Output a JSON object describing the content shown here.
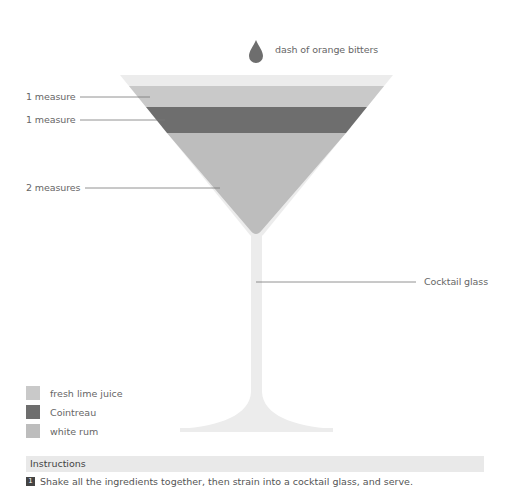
{
  "garnish": {
    "icon": "drop-icon",
    "label": "dash of orange bitters"
  },
  "layers": [
    {
      "label": "1 measure",
      "ingredient": "fresh lime juice",
      "color": "#c9c9c9"
    },
    {
      "label": "1 measure",
      "ingredient": "Cointreau",
      "color": "#6e6e6e"
    },
    {
      "label": "2 measures",
      "ingredient": "white rum",
      "color": "#bdbdbd"
    }
  ],
  "glass": {
    "label": "Cocktail glass",
    "color": "#ececec"
  },
  "legend": [
    {
      "label": "fresh lime juice",
      "color": "#c9c9c9"
    },
    {
      "label": "Cointreau",
      "color": "#6e6e6e"
    },
    {
      "label": "white rum",
      "color": "#bdbdbd"
    }
  ],
  "instructions": {
    "title": "Instructions",
    "steps": [
      {
        "number": "1",
        "text": "Shake all the ingredients together, then strain into a cocktail glass, and serve."
      }
    ]
  }
}
